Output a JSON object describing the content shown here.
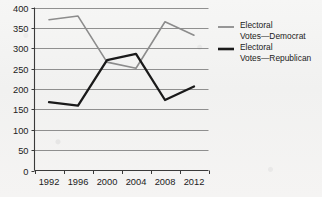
{
  "chart_data": {
    "type": "line",
    "title": "",
    "xlabel": "",
    "ylabel": "",
    "categories": [
      "1992",
      "1996",
      "2000",
      "2004",
      "2008",
      "2012"
    ],
    "ylim": [
      0,
      400
    ],
    "yticks": [
      0,
      50,
      100,
      150,
      200,
      250,
      300,
      350,
      400
    ],
    "grid": true,
    "legend_position": "right",
    "series": [
      {
        "name": "Electoral Votes—Democrat",
        "color": "#8c8c8c",
        "values": [
          370,
          379,
          266,
          251,
          365,
          332
        ]
      },
      {
        "name": "Electoral Votes—Republican",
        "color": "#1a1a1a",
        "values": [
          168,
          159,
          271,
          286,
          173,
          206
        ]
      }
    ]
  },
  "legend": {
    "entries": [
      {
        "line1": "Electoral",
        "line2": "Votes—Democrat",
        "swatch_name": "legend-swatch-democrat"
      },
      {
        "line1": "Electoral",
        "line2": "Votes—Republican",
        "swatch_name": "legend-swatch-republican"
      }
    ]
  },
  "axes": {
    "y_labels": [
      "400",
      "350",
      "300",
      "250",
      "200",
      "150",
      "100",
      "50",
      "0"
    ],
    "x_labels": [
      "1992",
      "1996",
      "2000",
      "2004",
      "2008",
      "2012"
    ]
  },
  "colors": {
    "democrat": "#8c8c8c",
    "republican": "#1a1a1a",
    "grid": "#6e6e6e",
    "axis": "#3a3a3a",
    "background": "#f3f3f2"
  }
}
